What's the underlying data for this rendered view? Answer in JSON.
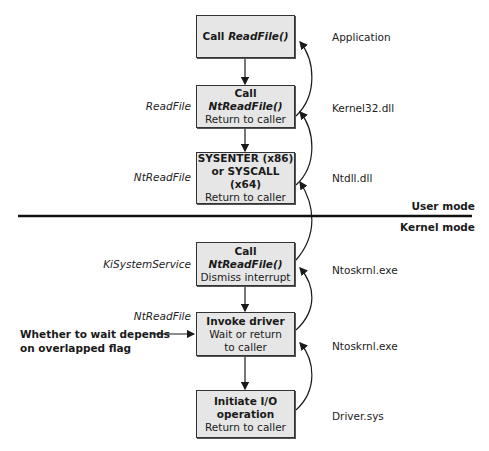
{
  "diagram": {
    "boxes": [
      {
        "id": "call-readfile",
        "line1_prefix": "Call ",
        "line1_func": "ReadFile()",
        "line2": "",
        "left_label": "",
        "right_label": "Application"
      },
      {
        "id": "call-ntreadfile-user",
        "line1_prefix": "Call ",
        "line1_func": "NtReadFile()",
        "line2": "Return to caller",
        "left_label": "ReadFile",
        "right_label": "Kernel32.dll"
      },
      {
        "id": "sysenter",
        "line1": "SYSENTER (x86)",
        "line1b": "or SYSCALL (x64)",
        "line2": "Return to caller",
        "left_label": "NtReadFile",
        "right_label": "Ntdll.dll"
      },
      {
        "id": "call-ntreadfile-kernel",
        "line1_prefix": "Call ",
        "line1_func": "NtReadFile()",
        "line2": "Dismiss interrupt",
        "left_label": "KiSystemService",
        "right_label": "Ntoskrnl.exe"
      },
      {
        "id": "invoke-driver",
        "line1": "Invoke driver",
        "line2": "Wait or return",
        "line3": "to caller",
        "left_label": "NtReadFile",
        "right_label": "Ntoskrnl.exe"
      },
      {
        "id": "initiate-io",
        "line1": "Initiate I/O",
        "line1b": "operation",
        "line2": "Return to caller",
        "left_label": "",
        "right_label": "Driver.sys"
      }
    ],
    "mode_boundary": {
      "upper": "User mode",
      "lower": "Kernel mode"
    },
    "note": {
      "line1": "Whether to wait depends",
      "line2": "on overlapped flag"
    },
    "colors": {
      "box_fill": "#e6e6e6",
      "stroke": "#1a1a1a"
    }
  }
}
